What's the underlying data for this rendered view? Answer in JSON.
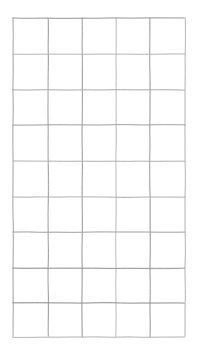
{
  "document": {
    "title": "Hand-drawn blank grid",
    "kind": "grid-diagram",
    "background_color": "#ffffff",
    "width": 198,
    "height": 355
  },
  "grid": {
    "name": "hand-drawn-grid",
    "columns": 5,
    "rows": 9,
    "cells_total": 45,
    "cell_text": "",
    "line_color": "#a9a9a9",
    "line_color_light": "#c6c6c6",
    "line_color_dark": "#8e8e8e",
    "line_width": 0.9,
    "style": "hand-drawn pencil, slightly irregular strokes",
    "bounds": {
      "left": 13,
      "top": 18,
      "right": 185,
      "bottom": 337
    },
    "vertical_line_x": [
      13,
      48,
      82,
      116,
      150,
      185
    ],
    "horizontal_line_y": [
      18,
      54,
      90,
      125,
      161,
      197,
      232,
      268,
      303,
      337
    ],
    "column_width_avg": 34.4,
    "row_height_avg": 35.4
  },
  "chart_data": {
    "type": "table",
    "xlabel": "",
    "ylabel": "",
    "columns": [
      "",
      "",
      "",
      "",
      ""
    ],
    "rows": [
      [
        "",
        "",
        "",
        "",
        ""
      ],
      [
        "",
        "",
        "",
        "",
        ""
      ],
      [
        "",
        "",
        "",
        "",
        ""
      ],
      [
        "",
        "",
        "",
        "",
        ""
      ],
      [
        "",
        "",
        "",
        "",
        ""
      ],
      [
        "",
        "",
        "",
        "",
        ""
      ],
      [
        "",
        "",
        "",
        "",
        ""
      ],
      [
        "",
        "",
        "",
        "",
        ""
      ],
      [
        "",
        "",
        "",
        "",
        ""
      ]
    ],
    "grid": true,
    "legend": false
  }
}
